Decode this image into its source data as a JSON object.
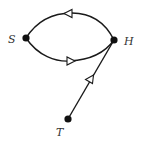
{
  "diagram": {
    "type": "directed-graph",
    "nodes": [
      {
        "id": "S",
        "label": "S",
        "x": 26,
        "y": 38
      },
      {
        "id": "H",
        "label": "H",
        "x": 114,
        "y": 40
      },
      {
        "id": "T",
        "label": "T",
        "x": 68,
        "y": 119
      }
    ],
    "edges": [
      {
        "from": "H",
        "to": "S",
        "style": "curved-upper",
        "arrowhead": "open-triangle"
      },
      {
        "from": "S",
        "to": "H",
        "style": "curved-lower",
        "arrowhead": "open-triangle"
      },
      {
        "from": "T",
        "to": "H",
        "style": "straight",
        "arrowhead": "open-triangle"
      }
    ],
    "colors": {
      "line": "#1a1a1a",
      "node": "#111111",
      "label": "#333333",
      "background": "#ffffff"
    }
  }
}
